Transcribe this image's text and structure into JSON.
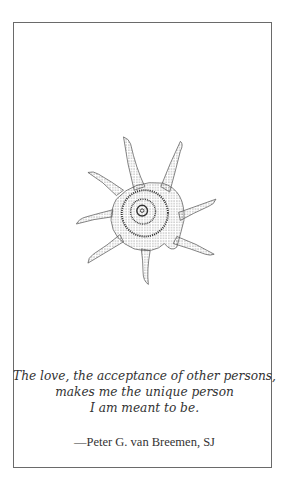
{
  "card": {
    "illustration": "spiny-spiral-seashell-stipple-drawing",
    "quote_lines": [
      "The love, the acceptance of other persons,",
      "makes me the unique person",
      "I am meant to be."
    ],
    "attribution": "—Peter G. van Breemen, SJ"
  }
}
